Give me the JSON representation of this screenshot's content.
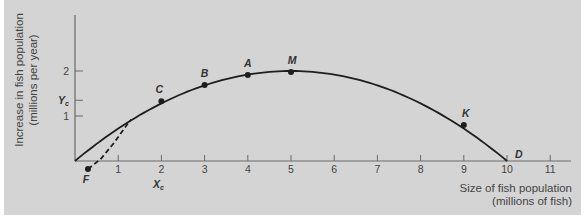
{
  "chart_data": {
    "type": "line",
    "title": "",
    "xlabel": "Size of fish population (millions of fish)",
    "ylabel": "Increase in fish population (millions per year)",
    "xlabel_lines": [
      "Size of fish population",
      "(millions of fish)"
    ],
    "ylabel_lines": [
      "Increase in fish population",
      "(millions per year)"
    ],
    "xlim": [
      0,
      11.5
    ],
    "ylim": [
      0,
      3.2
    ],
    "x_ticks": [
      1,
      2,
      3,
      4,
      5,
      6,
      7,
      8,
      9,
      10,
      11
    ],
    "y_ticks": [
      {
        "value": 1,
        "label": "1"
      },
      {
        "value": 1.35,
        "label": "Y",
        "sub": "c"
      },
      {
        "value": 2,
        "label": "2"
      }
    ],
    "grid": false,
    "legend": null,
    "series": [
      {
        "name": "growth-curve",
        "style": "solid",
        "x": [
          0,
          1,
          2,
          3,
          4,
          5,
          6,
          7,
          8,
          9,
          10
        ],
        "y": [
          0,
          0.72,
          1.28,
          1.68,
          1.92,
          2.0,
          1.92,
          1.68,
          1.28,
          0.72,
          0
        ]
      },
      {
        "name": "critical-depensation-curve",
        "style": "dashed",
        "x": [
          0.3,
          0.6,
          0.9,
          1.2,
          1.3
        ],
        "y": [
          -0.18,
          0.05,
          0.4,
          0.8,
          0.92
        ]
      }
    ],
    "points": [
      {
        "label": "F",
        "x": 0.3,
        "y": -0.18
      },
      {
        "label": "C",
        "x": 2,
        "y": 1.33
      },
      {
        "label": "B",
        "x": 3,
        "y": 1.69
      },
      {
        "label": "A",
        "x": 4,
        "y": 1.91
      },
      {
        "label": "M",
        "x": 5,
        "y": 1.98
      },
      {
        "label": "K",
        "x": 9,
        "y": 0.8
      },
      {
        "label": "D",
        "x": 10,
        "y": 0
      }
    ],
    "annotations": [
      {
        "text": "X",
        "sub": "c",
        "x": 2,
        "position": "below x-axis"
      },
      {
        "text": "Y",
        "sub": "c",
        "y": 1.35,
        "position": "left of y-axis"
      }
    ]
  }
}
